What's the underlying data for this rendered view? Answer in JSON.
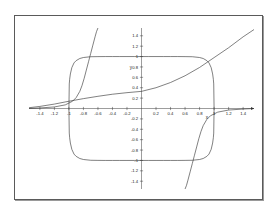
{
  "figure": {
    "background_color": "#ffffff",
    "frame_color": "#5a5a5a",
    "curve_color": "#2b2b2b",
    "axis_color": "#3a3a3a"
  },
  "chart_data": {
    "type": "line",
    "title": "",
    "xlabel": "x",
    "ylabel": "y",
    "grid": false,
    "legend": "none",
    "xlim": [
      -1.55,
      1.55
    ],
    "ylim": [
      -1.55,
      1.55
    ],
    "xticks": [
      -1.4,
      -1.2,
      -1,
      -0.8,
      -0.6,
      -0.4,
      -0.2,
      0.2,
      0.4,
      0.6,
      0.8,
      1,
      1.2,
      1.4
    ],
    "xtick_labels": [
      "-1.4",
      "-1.2",
      "-1",
      "-0.8",
      "-0.6",
      "-0.4",
      "-0.2",
      "0.2",
      "0.4",
      "0.6",
      "0.8",
      "1",
      "1.2",
      "1.4"
    ],
    "yticks": [
      -1.4,
      -1.2,
      -1,
      -0.8,
      -0.6,
      -0.4,
      -0.2,
      0.2,
      0.4,
      0.6,
      0.8,
      1,
      1.2,
      1.4
    ],
    "ytick_labels": [
      "-1.4",
      "-1.2",
      "-1",
      "-0.8",
      "-0.6",
      "-0.4",
      "-0.2",
      "0.2",
      "0.4",
      "0.6",
      "0.8",
      "1",
      "1.2",
      "1.4"
    ],
    "series": [
      {
        "name": "squircle",
        "description": "closed superellipse curve, |x|^4 + |y|^4 = 1",
        "x": [
          1.0,
          0.995,
          0.99,
          0.98,
          0.96,
          0.93,
          0.9,
          0.85,
          0.8,
          0.7,
          0.6,
          0.5,
          0.4,
          0.3,
          0.2,
          0.1,
          0.0,
          -0.1,
          -0.2,
          -0.3,
          -0.4,
          -0.5,
          -0.6,
          -0.7,
          -0.8,
          -0.85,
          -0.9,
          -0.93,
          -0.96,
          -0.98,
          -0.99,
          -0.995,
          -1.0
        ],
        "y": [
          0.0,
          0.473,
          0.562,
          0.665,
          0.786,
          0.878,
          0.922,
          0.963,
          0.982,
          0.997,
          0.999,
          1.0,
          1.0,
          1.0,
          1.0,
          1.0,
          1.0,
          1.0,
          1.0,
          1.0,
          1.0,
          1.0,
          0.999,
          0.997,
          0.982,
          0.963,
          0.922,
          0.878,
          0.786,
          0.665,
          0.562,
          0.473,
          0.0
        ]
      },
      {
        "name": "gentle-increasing-curve",
        "description": "slowly rising curve through approximately (0, 0.33)",
        "x": [
          -1.55,
          -1.4,
          -1.2,
          -1.0,
          -0.8,
          -0.6,
          -0.4,
          -0.2,
          0.0,
          0.2,
          0.4,
          0.6,
          0.8,
          1.0,
          1.2,
          1.4,
          1.55
        ],
        "y": [
          0.015,
          0.04,
          0.085,
          0.14,
          0.19,
          0.235,
          0.275,
          0.305,
          0.33,
          0.4,
          0.5,
          0.63,
          0.79,
          0.98,
          1.17,
          1.38,
          1.52
        ]
      },
      {
        "name": "steep-curve-upper-left",
        "description": "steeply rising branch near x = -0.8",
        "x": [
          -1.55,
          -1.4,
          -1.2,
          -1.05,
          -0.95,
          -0.9,
          -0.85,
          -0.82,
          -0.79,
          -0.76,
          -0.73,
          -0.7,
          -0.67,
          -0.64,
          -0.62,
          -0.6
        ],
        "y": [
          0.0,
          0.01,
          0.03,
          0.07,
          0.14,
          0.21,
          0.33,
          0.44,
          0.58,
          0.74,
          0.9,
          1.06,
          1.22,
          1.38,
          1.48,
          1.55
        ]
      },
      {
        "name": "steep-curve-lower-right",
        "description": "steeply rising branch near x = 0.9 in the lower half plane",
        "x": [
          0.6,
          0.62,
          0.64,
          0.67,
          0.7,
          0.73,
          0.76,
          0.79,
          0.82,
          0.85,
          0.9,
          0.95,
          1.05,
          1.2,
          1.4,
          1.55
        ],
        "y": [
          -1.55,
          -1.48,
          -1.38,
          -1.22,
          -1.06,
          -0.9,
          -0.74,
          -0.58,
          -0.44,
          -0.33,
          -0.21,
          -0.14,
          -0.07,
          -0.03,
          -0.01,
          0.0
        ]
      }
    ]
  }
}
